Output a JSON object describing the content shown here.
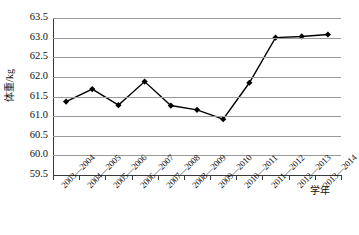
{
  "chart_data": {
    "type": "line",
    "title": "",
    "xlabel": "学年",
    "ylabel": "体重/kg",
    "categories": [
      "2003—2004",
      "2004—2005",
      "2005—2006",
      "2006—2007",
      "2007—2008",
      "2008—2009",
      "2009—2010",
      "2010—2011",
      "2011—2012",
      "2012—2013",
      "2013—2014"
    ],
    "values": [
      61.37,
      61.69,
      61.28,
      61.88,
      61.27,
      61.16,
      60.92,
      61.85,
      63.0,
      63.03,
      63.08
    ],
    "ylim": [
      59.5,
      63.5
    ],
    "ytick_labels": [
      "63.5",
      "63.0",
      "62.5",
      "62.0",
      "61.5",
      "61.0",
      "60.5",
      "60.0",
      "59.5"
    ],
    "ytick_values": [
      63.5,
      63.0,
      62.5,
      62.0,
      61.5,
      61.0,
      60.5,
      60.0,
      59.5
    ],
    "grid": true,
    "legend": false,
    "series_color": "#000000",
    "grid_color": "#9a9a9a",
    "axis_color": "#3a3a3a",
    "marker": "diamond"
  }
}
